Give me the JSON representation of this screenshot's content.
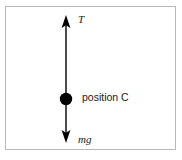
{
  "diagram": {
    "frame": {
      "border_color": "#b9b9b9",
      "background_color": "#ffffff"
    },
    "stroke_color": "#000000",
    "labels": {
      "tension": "T",
      "weight": "mg",
      "position": "position C"
    },
    "vectors": [
      {
        "name": "tension-vector",
        "label": "T",
        "direction": "up",
        "x": 66,
        "tail_y": 99,
        "tip_y": 16
      },
      {
        "name": "weight-vector",
        "label": "mg",
        "direction": "down",
        "x": 66,
        "tail_y": 99,
        "tip_y": 142
      }
    ],
    "point_mass": {
      "name": "position C",
      "cx": 66,
      "cy": 99,
      "r": 6,
      "fill": "#000000"
    }
  }
}
